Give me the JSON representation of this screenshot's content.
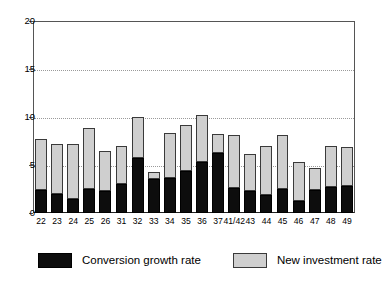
{
  "chart_data": {
    "type": "bar",
    "subtype": "stacked-vertical",
    "title": "",
    "xlabel": "",
    "ylabel": "",
    "ylim": [
      0,
      20
    ],
    "yticks": [
      0,
      5,
      10,
      15,
      20
    ],
    "ytick_labels": [
      "0",
      "5",
      "10",
      "15",
      "20"
    ],
    "grid": "horizontal-dotted",
    "legend_position": "bottom",
    "categories": [
      "22",
      "23",
      "24",
      "25",
      "26",
      "31",
      "32",
      "33",
      "34",
      "35",
      "36",
      "37",
      "41/42",
      "43",
      "44",
      "45",
      "46",
      "47",
      "48",
      "49"
    ],
    "series": [
      {
        "name": "Conversion growth rate",
        "color": "#0d0d0d",
        "values": [
          2.4,
          2.0,
          1.5,
          2.5,
          2.3,
          3.0,
          5.7,
          3.5,
          3.6,
          4.4,
          5.3,
          6.3,
          2.6,
          2.3,
          1.9,
          2.5,
          1.3,
          2.4,
          2.7,
          2.8
        ]
      },
      {
        "name": "New investment rate",
        "color": "#cfcfcf",
        "values": [
          5.3,
          5.2,
          5.7,
          6.4,
          4.2,
          4.0,
          4.3,
          0.8,
          4.7,
          4.8,
          4.9,
          1.9,
          5.5,
          3.8,
          5.1,
          5.6,
          4.0,
          2.3,
          4.3,
          4.1
        ]
      }
    ],
    "totals": [
      7.7,
      7.2,
      7.2,
      8.9,
      6.5,
      7.0,
      10.0,
      4.3,
      8.3,
      9.2,
      10.2,
      8.2,
      8.1,
      6.1,
      7.0,
      8.1,
      5.3,
      4.7,
      7.0,
      6.9
    ]
  }
}
